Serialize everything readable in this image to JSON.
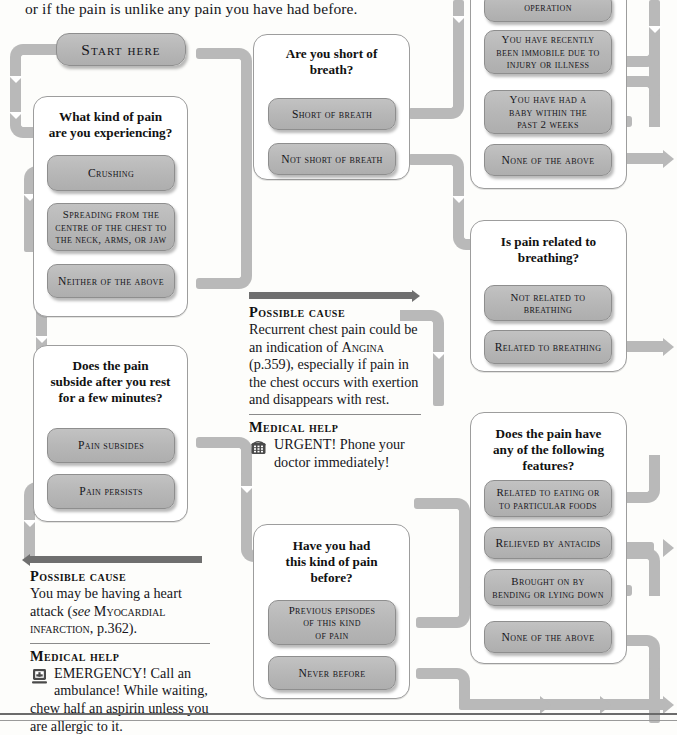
{
  "page": {
    "intro_text": "or if the pain is unlike any pain you have had before.",
    "background_color": "#fdfdfb",
    "connector_color": "#b9b9b9",
    "chip_color": "#b6b6b6",
    "panel_bar_color": "#6f6f6f"
  },
  "start": {
    "label": "Start here"
  },
  "questions": {
    "pain_kind": {
      "title": "What kind of pain\nare you experiencing?",
      "answers": [
        {
          "label": "Crushing"
        },
        {
          "label": "Spreading from the\ncentre of the chest to\nthe neck, arms, or jaw"
        },
        {
          "label": "Neither of the above"
        }
      ]
    },
    "pain_subside": {
      "title": "Does the pain\nsubside after you rest\nfor a few minutes?",
      "answers": [
        {
          "label": "Pain subsides"
        },
        {
          "label": "Pain persists"
        }
      ]
    },
    "short_of_breath": {
      "title": "Are you short of\nbreath?",
      "answers": [
        {
          "label": "Short of breath"
        },
        {
          "label": "Not short of breath"
        }
      ]
    },
    "risk_factors": {
      "answers": [
        {
          "label": "operation"
        },
        {
          "label": "You have recently\nbeen immobile due to\ninjury or illness"
        },
        {
          "label": "You have had a\nbaby within the\npast 2 weeks"
        },
        {
          "label": "None of the above"
        }
      ]
    },
    "breathing_related": {
      "title": "Is pain related to\nbreathing?",
      "answers": [
        {
          "label": "Not related to\nbreathing"
        },
        {
          "label": "Related to breathing"
        }
      ]
    },
    "pain_before": {
      "title": "Have you had\nthis kind of pain\nbefore?",
      "answers": [
        {
          "label": "Previous episodes\nof this kind\nof pain"
        },
        {
          "label": "Never before"
        }
      ]
    },
    "pain_features": {
      "title": "Does the pain have\nany of the following\nfeatures?",
      "answers": [
        {
          "label": "Related to eating or\nto particular foods"
        },
        {
          "label": "Relieved by antacids"
        },
        {
          "label": "Brought on by\nbending or lying down"
        },
        {
          "label": "None of the above"
        }
      ]
    }
  },
  "panels": {
    "heart_attack": {
      "cause_heading": "Possible cause",
      "cause_text_1": "You may be having a heart attack (",
      "cause_italic": "see",
      "cause_smallcaps": " Myocardial infarction",
      "cause_text_2": ", p.362).",
      "help_heading": "Medical help",
      "help_icon": "ambulance-icon",
      "help_text": "EMERGENCY! Call an ambulance! While waiting, chew half an aspirin unless you are allergic to it."
    },
    "angina": {
      "cause_heading": "Possible cause",
      "cause_text_1": "Recurrent chest pain could be an indication of ",
      "cause_smallcaps": "Angina",
      "cause_text_2": " (p.359), especially if pain in the chest occurs with exertion and disappears with rest.",
      "help_heading": "Medical help",
      "help_icon": "telephone-icon",
      "help_text": "URGENT! Phone your doctor immediately!"
    }
  }
}
